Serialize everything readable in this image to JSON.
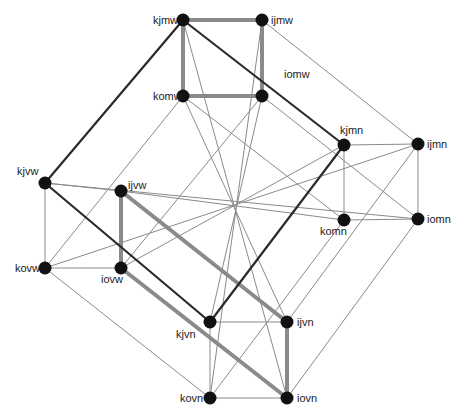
{
  "diagram": {
    "type": "graph",
    "colors": {
      "node": "#111111",
      "thin_edge": "#8a8a8a",
      "thick_edge": "#8a8a8a",
      "dark_edge": "#2a2a2a",
      "label": "#222222"
    },
    "nodes": [
      {
        "id": "kjmw",
        "label": "kjmw"
      },
      {
        "id": "ijmw",
        "label": "ijmw"
      },
      {
        "id": "komw",
        "label": "komw"
      },
      {
        "id": "iomw",
        "label": "iomw"
      },
      {
        "id": "kjmn",
        "label": "kjmn"
      },
      {
        "id": "ijmn",
        "label": "ijmn"
      },
      {
        "id": "komn",
        "label": "komn"
      },
      {
        "id": "iomn",
        "label": "iomn"
      },
      {
        "id": "kjvw",
        "label": "kjvw"
      },
      {
        "id": "ijvw",
        "label": "ijvw"
      },
      {
        "id": "kovw",
        "label": "kovw"
      },
      {
        "id": "iovw",
        "label": "iovw"
      },
      {
        "id": "kjvn",
        "label": "kjvn"
      },
      {
        "id": "ijvn",
        "label": "ijvn"
      },
      {
        "id": "kovn",
        "label": "kovn"
      },
      {
        "id": "iovn",
        "label": "iovn"
      }
    ],
    "edges": [
      {
        "from": "kjmw",
        "to": "ijmw",
        "style": "thick"
      },
      {
        "from": "kjmw",
        "to": "komw",
        "style": "thick"
      },
      {
        "from": "ijmw",
        "to": "iomw",
        "style": "thick"
      },
      {
        "from": "komw",
        "to": "iomw",
        "style": "thick"
      },
      {
        "from": "ijvw",
        "to": "iovw",
        "style": "thick"
      },
      {
        "from": "ijvw",
        "to": "ijvn",
        "style": "thick"
      },
      {
        "from": "iovw",
        "to": "iovn",
        "style": "thick"
      },
      {
        "from": "ijvn",
        "to": "iovn",
        "style": "thick"
      },
      {
        "from": "kjmw",
        "to": "kjvw",
        "style": "dark"
      },
      {
        "from": "kjmw",
        "to": "kjmn",
        "style": "dark"
      },
      {
        "from": "kjvw",
        "to": "kjvn",
        "style": "dark"
      },
      {
        "from": "kjmn",
        "to": "kjvn",
        "style": "dark"
      },
      {
        "from": "ijmw",
        "to": "ijmn",
        "style": "thin"
      },
      {
        "from": "kjmn",
        "to": "ijmn",
        "style": "thin"
      },
      {
        "from": "kjmn",
        "to": "komn",
        "style": "thin"
      },
      {
        "from": "ijmn",
        "to": "iomn",
        "style": "thin"
      },
      {
        "from": "komn",
        "to": "iomn",
        "style": "thin"
      },
      {
        "from": "kjvw",
        "to": "ijvw",
        "style": "thin"
      },
      {
        "from": "kjvw",
        "to": "kovw",
        "style": "thin"
      },
      {
        "from": "kovw",
        "to": "iovw",
        "style": "thin"
      },
      {
        "from": "kjvn",
        "to": "ijvn",
        "style": "thin"
      },
      {
        "from": "kjvn",
        "to": "kovn",
        "style": "thin"
      },
      {
        "from": "kovn",
        "to": "iovn",
        "style": "thin"
      },
      {
        "from": "kovw",
        "to": "kovn",
        "style": "thin"
      },
      {
        "from": "iomn",
        "to": "iovn",
        "style": "thin"
      },
      {
        "from": "ijmn",
        "to": "ijvn",
        "style": "thin"
      },
      {
        "from": "komn",
        "to": "kovn",
        "style": "thin"
      },
      {
        "from": "komw",
        "to": "kovw",
        "style": "thin"
      },
      {
        "from": "iomw",
        "to": "iovw",
        "style": "thin"
      },
      {
        "from": "komw",
        "to": "komn",
        "style": "thin"
      },
      {
        "from": "iomw",
        "to": "iomn",
        "style": "thin"
      },
      {
        "from": "kjvw",
        "to": "iomn",
        "style": "thin"
      },
      {
        "from": "ijvw",
        "to": "komn",
        "style": "thin"
      },
      {
        "from": "kovw",
        "to": "ijmn",
        "style": "thin"
      },
      {
        "from": "iovw",
        "to": "kjmn",
        "style": "thin"
      },
      {
        "from": "kjmw",
        "to": "iovn",
        "style": "thin"
      },
      {
        "from": "ijmw",
        "to": "kovn",
        "style": "thin"
      },
      {
        "from": "komw",
        "to": "ijvn",
        "style": "thin"
      },
      {
        "from": "iomw",
        "to": "kjvn",
        "style": "thin"
      }
    ]
  }
}
